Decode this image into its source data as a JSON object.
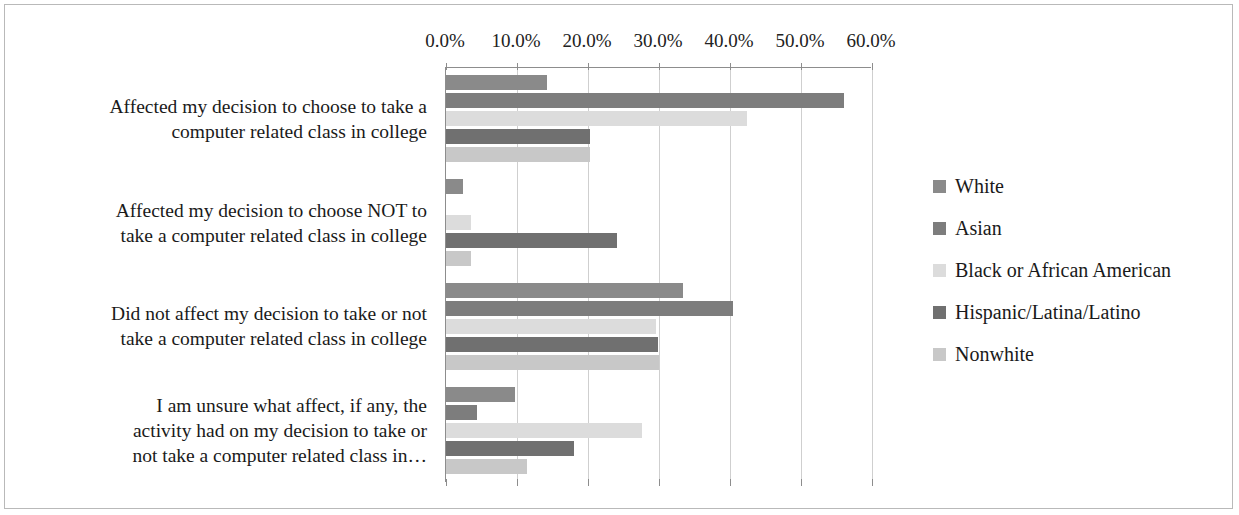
{
  "chart_data": {
    "type": "bar",
    "orientation": "horizontal",
    "title": "",
    "xlabel": "",
    "ylabel": "",
    "xlim": [
      0,
      60
    ],
    "xticks": [
      0,
      10,
      20,
      30,
      40,
      50,
      60
    ],
    "xtick_labels": [
      "0.0%",
      "10.0%",
      "20.0%",
      "30.0%",
      "40.0%",
      "50.0%",
      "60.0%"
    ],
    "grid": true,
    "legend_position": "right",
    "categories": [
      "Affected my decision to choose to take a computer related class in college",
      "Affected my decision to choose NOT to take a computer related class in college",
      "Did not affect my decision to take or not take a computer related class in college",
      "I am unsure what affect, if any, the activity had on my decision to take or not take a computer related class in…"
    ],
    "category_lines": [
      [
        "Affected my decision to choose to take a",
        "computer related class in college"
      ],
      [
        "Affected my decision to choose NOT to",
        "take a computer related class in college"
      ],
      [
        "Did not affect my decision to take or not",
        "take a computer related class in college"
      ],
      [
        "I am unsure what affect, if any, the",
        "activity had on my decision to take or",
        "not take a computer related class in…"
      ]
    ],
    "series": [
      {
        "name": "White",
        "color": "#8a8a8a",
        "values": [
          14.2,
          2.4,
          33.4,
          9.7
        ]
      },
      {
        "name": "Asian",
        "color": "#7d7d7d",
        "values": [
          56.0,
          0.0,
          40.4,
          4.4
        ]
      },
      {
        "name": "Black or African American",
        "color": "#dcdcdc",
        "values": [
          42.4,
          3.5,
          29.6,
          27.6
        ]
      },
      {
        "name": "Hispanic/Latina/Latino",
        "color": "#707070",
        "values": [
          20.3,
          24.1,
          29.8,
          18.0
        ]
      },
      {
        "name": "Nonwhite",
        "color": "#c8c8c8",
        "values": [
          20.3,
          3.5,
          30.0,
          11.4
        ]
      }
    ]
  },
  "legend": {
    "items": [
      {
        "label": "White",
        "color": "#8a8a8a"
      },
      {
        "label": "Asian",
        "color": "#7d7d7d"
      },
      {
        "label": "Black or African American",
        "color": "#dcdcdc"
      },
      {
        "label": "Hispanic/Latina/Latino",
        "color": "#707070"
      },
      {
        "label": "Nonwhite",
        "color": "#c8c8c8"
      }
    ]
  }
}
